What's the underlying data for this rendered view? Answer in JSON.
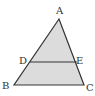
{
  "diagram": {
    "type": "triangle-with-parallel-segment",
    "fill_color": "#dcdcdc",
    "stroke_color": "#333333",
    "points": {
      "A": {
        "label": "A",
        "x": 59,
        "y": 19
      },
      "B": {
        "label": "B",
        "x": 14,
        "y": 85
      },
      "C": {
        "label": "C",
        "x": 84,
        "y": 85
      },
      "D": {
        "label": "D",
        "x": 30,
        "y": 62
      },
      "E": {
        "label": "E",
        "x": 77,
        "y": 62
      }
    },
    "segments": [
      "AB",
      "AC",
      "BC",
      "DE"
    ]
  }
}
